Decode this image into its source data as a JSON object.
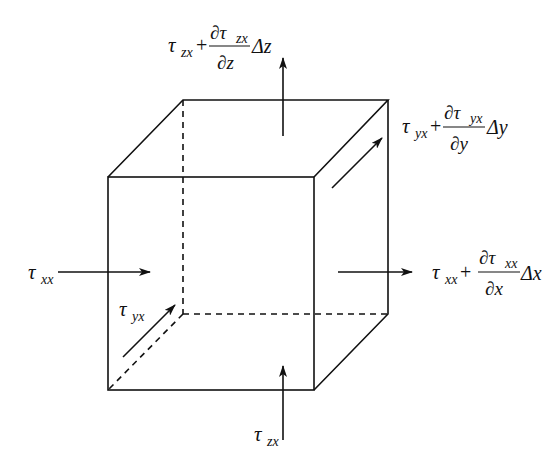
{
  "diagram": {
    "labels": {
      "top": {
        "base": "τ",
        "sub": "zx",
        "plus": "+",
        "num_d": "∂τ",
        "num_sub": "zx",
        "den": "∂z",
        "delta": "Δz"
      },
      "right_back": {
        "base": "τ",
        "sub": "yx",
        "plus": "+",
        "num_d": "∂τ",
        "num_sub": "yx",
        "den": "∂y",
        "delta": "Δy"
      },
      "right": {
        "base": "τ",
        "sub": "xx",
        "plus": "+",
        "num_d": "∂τ",
        "num_sub": "xx",
        "den": "∂x",
        "delta": "Δx"
      },
      "left": {
        "base": "τ",
        "sub": "xx"
      },
      "front_diag": {
        "base": "τ",
        "sub": "yx"
      },
      "bottom": {
        "base": "τ",
        "sub": "zx"
      }
    },
    "colors": {
      "line": "#111111",
      "background": "#ffffff"
    }
  }
}
